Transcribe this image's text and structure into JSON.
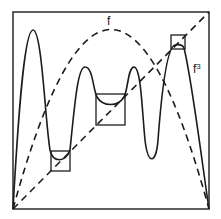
{
  "figure": {
    "labels": {
      "f": "f",
      "f3_base": "f",
      "f3_exp": "3"
    },
    "colors": {
      "ink": "#1c1c1c",
      "background": "#ffffff"
    },
    "frame": {
      "x0": 13,
      "y0": 12,
      "x1": 209,
      "y1": 209
    },
    "curves": [
      {
        "name": "f",
        "style": "dashed",
        "description": "parabola-like map, peak at center top"
      },
      {
        "name": "diagonal",
        "style": "dashed",
        "description": "identity line y = x"
      },
      {
        "name": "f3",
        "style": "solid",
        "description": "third iterate with four humps"
      }
    ],
    "boxes": [
      {
        "name": "left-small-box",
        "x": 51,
        "y": 151,
        "w": 19,
        "h": 20
      },
      {
        "name": "center-box",
        "x": 96,
        "y": 94,
        "w": 29,
        "h": 31
      },
      {
        "name": "top-right-box",
        "x": 171,
        "y": 35,
        "w": 14,
        "h": 14
      }
    ]
  }
}
